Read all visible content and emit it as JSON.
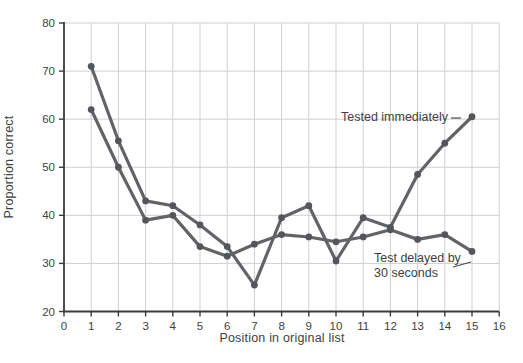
{
  "figure": {
    "background": "#ffffff"
  },
  "chart_data": {
    "type": "line",
    "title": "",
    "xlabel": "Position in original list",
    "ylabel": "Proportion correct",
    "xlim": [
      0,
      16
    ],
    "ylim": [
      20,
      80
    ],
    "x_ticks": [
      0,
      1,
      2,
      3,
      4,
      5,
      6,
      7,
      8,
      9,
      10,
      11,
      12,
      13,
      14,
      15,
      16
    ],
    "y_ticks": [
      20,
      30,
      40,
      50,
      60,
      70,
      80
    ],
    "grid": true,
    "legend_position": "inline-annotations",
    "x": [
      1,
      2,
      3,
      4,
      5,
      6,
      7,
      8,
      9,
      10,
      11,
      12,
      13,
      14,
      15
    ],
    "series": [
      {
        "name": "Tested immediately",
        "values": [
          71,
          55.5,
          43,
          42,
          38,
          33.5,
          25.5,
          39.5,
          42,
          30.5,
          39.5,
          37.5,
          48.5,
          55,
          60.5
        ]
      },
      {
        "name": "Test delayed by 30 seconds",
        "values": [
          62,
          50,
          39,
          40,
          33.5,
          31.5,
          34,
          36,
          35.5,
          34.5,
          35.5,
          37,
          35,
          36,
          32.5
        ]
      }
    ],
    "annotations": [
      {
        "text": "Tested immediately",
        "leader": {
          "x1": 451,
          "y1": 118,
          "x2": 461,
          "y2": 118
        }
      },
      {
        "lines": [
          "Test delayed by",
          "30 seconds"
        ],
        "leader": {
          "x1": 453,
          "y1": 267,
          "x2": 471,
          "y2": 262
        }
      }
    ]
  },
  "style": {
    "line_color": "#616366",
    "marker_color": "#54565a",
    "grid_color": "#cdcfd1",
    "axis_color": "#3a3a3a",
    "text_color": "#3e3f41",
    "leader_color": "#4a4a4a"
  }
}
